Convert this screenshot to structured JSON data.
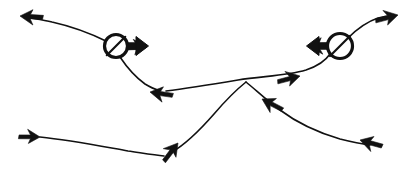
{
  "figure": {
    "title": "Hand-drawn arrow trajectory sketch",
    "width": 416,
    "height": 177,
    "background_color": "#ffffff",
    "ink_color": "#111111",
    "stroke_width_thin": 1.5,
    "stroke_width_node": 3.2
  },
  "nodes": [
    {
      "id": "left-node",
      "label": "circled node with rightward arrow",
      "cx": 116,
      "cy": 46,
      "r": 11.5,
      "slash_direction": "top-right-to-bottom-left",
      "arrow_direction": "right",
      "arrow_color": "#111111"
    },
    {
      "id": "right-node",
      "label": "circled node with leftward arrow",
      "cx": 340,
      "cy": 46,
      "r": 12.5,
      "slash_direction": "top-right-to-bottom-left",
      "arrow_direction": "left",
      "arrow_color": "#111111"
    }
  ],
  "curves": [
    {
      "id": "upper-left-curve",
      "label": "curve from left node to upper-left arrowhead",
      "path": "M 108 42 C 92 34, 70 26, 52 22 C 44 20, 36 19, 30 18",
      "stroke_width": 1.6
    },
    {
      "id": "left-descent-curve",
      "label": "curve descending from left node toward mid-left arrowhead",
      "path": "M 120 57 C 126 66, 134 76, 145 84 C 150 87, 154 89, 158 90",
      "stroke_width": 1.6
    },
    {
      "id": "mid-horizontal-curve",
      "label": "long middle curve running right from mid-left arrowhead through the crossing to the right node",
      "path": "M 166 91 C 190 88, 214 84, 238 80 C 262 76, 286 76, 306 70 C 318 66, 326 60, 330 54",
      "stroke_width": 1.6
    },
    {
      "id": "upper-right-curve",
      "label": "curve rising from right node to upper-right arrowhead",
      "path": "M 348 38 C 356 30, 366 22, 378 18 C 382 17, 386 16, 390 16",
      "stroke_width": 1.6
    },
    {
      "id": "lower-left-curve",
      "label": "low curve from bottom-left arrowhead to the bottom-middle upward arrowhead",
      "path": "M 40 137 C 70 140, 100 146, 128 151 C 142 153, 154 155, 164 156",
      "stroke_width": 1.6
    },
    {
      "id": "rising-cross-curve",
      "label": "curve rising from bottom-middle arrowhead up through the central crossing",
      "path": "M 172 152 C 186 144, 200 130, 214 114 C 226 100, 236 90, 246 82",
      "stroke_width": 1.6
    },
    {
      "id": "descending-cross-curve",
      "label": "curve descending right from the central crossing toward bottom-right arrowhead",
      "path": "M 246 82 C 256 90, 266 100, 280 110 C 296 122, 316 132, 340 139 C 352 142, 362 144, 370 145",
      "stroke_width": 1.6
    }
  ],
  "arrowheads": [
    {
      "id": "arrow-upper-left",
      "label": "upper-left arrowhead pointing left",
      "tip_x": 20,
      "tip_y": 16,
      "angle_deg": 188,
      "size": 13,
      "direction": "left"
    },
    {
      "id": "arrow-left-node",
      "label": "rightward arrow attached to left node",
      "tip_x": 147,
      "tip_y": 47,
      "angle_deg": 2,
      "size": 13,
      "direction": "right"
    },
    {
      "id": "arrow-mid-left",
      "label": "mid-left arrowhead pointing left along middle curve",
      "tip_x": 150,
      "tip_y": 92,
      "angle_deg": 193,
      "size": 13,
      "direction": "left"
    },
    {
      "id": "arrow-mid-right",
      "label": "arrowhead pointing right on middle curve before right node",
      "tip_x": 300,
      "tip_y": 76,
      "angle_deg": 350,
      "size": 13,
      "direction": "right"
    },
    {
      "id": "arrow-right-node",
      "label": "leftward arrow attached to right node",
      "tip_x": 308,
      "tip_y": 46,
      "angle_deg": 182,
      "size": 14,
      "direction": "left"
    },
    {
      "id": "arrow-upper-right",
      "label": "upper-right arrowhead pointing right",
      "tip_x": 398,
      "tip_y": 15,
      "angle_deg": 350,
      "size": 13,
      "direction": "right"
    },
    {
      "id": "arrow-bottom-left",
      "label": "bottom-left arrowhead pointing right at start of lower curve",
      "tip_x": 40,
      "tip_y": 137,
      "angle_deg": 5,
      "size": 12,
      "direction": "right"
    },
    {
      "id": "arrow-bottom-middle",
      "label": "bottom-middle arrowhead pointing up-right",
      "tip_x": 178,
      "tip_y": 143,
      "angle_deg": 312,
      "size": 13,
      "direction": "up-right"
    },
    {
      "id": "arrow-mid-descend",
      "label": "arrowhead pointing up-left on descending crossing curve",
      "tip_x": 262,
      "tip_y": 99,
      "angle_deg": 212,
      "size": 13,
      "direction": "up-left"
    },
    {
      "id": "arrow-bottom-right",
      "label": "bottom-right arrowhead pointing up-left",
      "tip_x": 360,
      "tip_y": 140,
      "angle_deg": 200,
      "size": 13,
      "direction": "up-left"
    }
  ]
}
